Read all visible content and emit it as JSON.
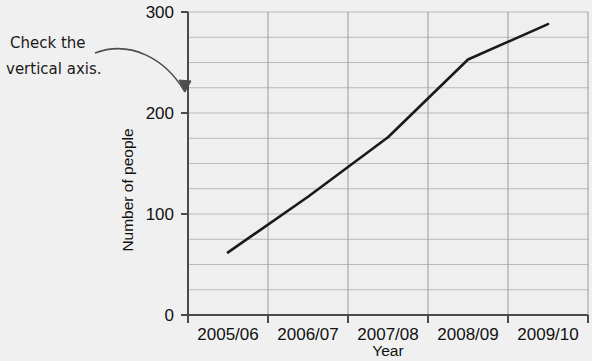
{
  "annotation": {
    "line1": "Check the",
    "line2": "vertical axis.",
    "name": "check-vertical-axis-note"
  },
  "chart_data": {
    "type": "line",
    "title": "",
    "subtitle": "",
    "xlabel": "Year",
    "ylabel": "Number of people",
    "categories": [
      "2005/06",
      "2006/07",
      "2007/08",
      "2008/09",
      "2009/10"
    ],
    "values": [
      62,
      117,
      176,
      253,
      288
    ],
    "series": [
      {
        "name": "Number of people",
        "values": [
          62,
          117,
          176,
          253,
          288
        ]
      }
    ],
    "ylim": [
      0,
      300
    ],
    "ytick_labels": [
      "0",
      "100",
      "200",
      "300"
    ],
    "ytick_values": [
      0,
      100,
      200,
      300
    ],
    "yminor_step": 25,
    "grid": true,
    "grid_axis": "both",
    "legend": false,
    "legend_position": "none",
    "line_color": "#1a1a1a",
    "grid_color": "#b9b9b9",
    "axis_color": "#4a4a4a",
    "background_color": "#f0f0f0",
    "plot_background_color": "#efefef",
    "annotations": [
      {
        "text": "Check the vertical axis.",
        "target": "y-axis value 210"
      }
    ]
  }
}
